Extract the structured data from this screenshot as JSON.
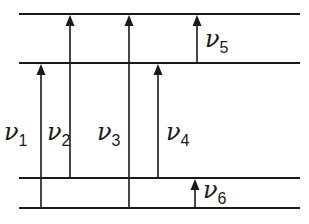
{
  "diagram": {
    "type": "energy-level-transitions",
    "levels": [
      {
        "id": "level-1",
        "y": 14
      },
      {
        "id": "level-2",
        "y": 63
      },
      {
        "id": "level-3",
        "y": 178
      },
      {
        "id": "level-4",
        "y": 208
      }
    ],
    "level_x_start": 19,
    "level_x_end": 300,
    "transitions": [
      {
        "id": "nu1",
        "symbol": "ν",
        "subscript": "1",
        "x": 41,
        "from_y": 208,
        "to_y": 63,
        "label_x": 4,
        "label_y": 140
      },
      {
        "id": "nu2",
        "symbol": "ν",
        "subscript": "2",
        "x": 70,
        "from_y": 178,
        "to_y": 14,
        "label_x": 47,
        "label_y": 140
      },
      {
        "id": "nu3",
        "symbol": "ν",
        "subscript": "3",
        "x": 129,
        "from_y": 208,
        "to_y": 14,
        "label_x": 97,
        "label_y": 140
      },
      {
        "id": "nu4",
        "symbol": "ν",
        "subscript": "4",
        "x": 158,
        "from_y": 178,
        "to_y": 63,
        "label_x": 166,
        "label_y": 140
      },
      {
        "id": "nu5",
        "symbol": "ν",
        "subscript": "5",
        "x": 197,
        "from_y": 63,
        "to_y": 14,
        "label_x": 205,
        "label_y": 47
      },
      {
        "id": "nu6",
        "symbol": "ν",
        "subscript": "6",
        "x": 195,
        "from_y": 208,
        "to_y": 178,
        "label_x": 203,
        "label_y": 198
      }
    ],
    "line_color": "#1a1a1a"
  }
}
